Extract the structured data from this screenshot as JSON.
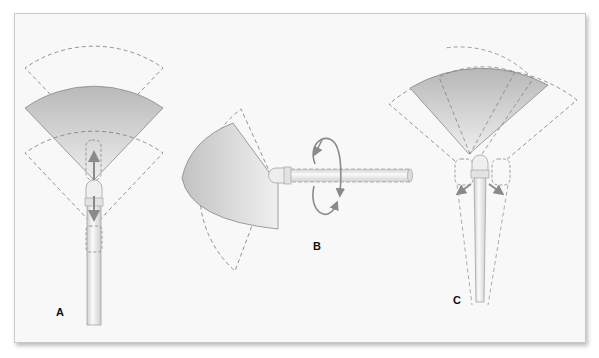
{
  "figure": {
    "panels": [
      {
        "id": "A",
        "label": "A",
        "motion": "advance-retract",
        "description": "Endoscope tip moves forward and backward along shaft axis, shifting field of view"
      },
      {
        "id": "B",
        "label": "B",
        "motion": "rotation",
        "description": "Endoscope rotates about its long axis, sweeping angled field of view"
      },
      {
        "id": "C",
        "label": "C",
        "motion": "tilt-lateral",
        "description": "Endoscope tilts side to side, shifting field of view laterally"
      }
    ],
    "colors": {
      "panel_bg": "#f8f8f8",
      "border": "#c9c9c9",
      "fov_fill_dark": "#bdbdbd",
      "fov_fill_light": "#ececec",
      "dashed_line": "#777777",
      "arrow": "#8a8a8a",
      "scope_body": "#e6e6e6"
    }
  }
}
